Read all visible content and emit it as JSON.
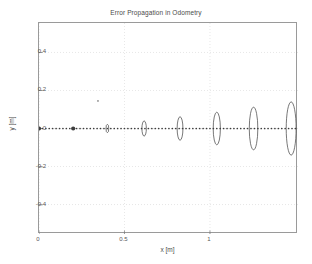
{
  "figure": {
    "background_color": "#ffffff",
    "axes_border_color": "#9a9a9a",
    "grid_color": "#cfcfcf",
    "data_color": "#3d3d3d"
  },
  "chart_data": {
    "type": "scatter",
    "title": "Error Propagation in Odometry",
    "xlabel": "x [m]",
    "ylabel": "y [m]",
    "xlim": [
      0,
      1.515
    ],
    "ylim": [
      -0.555,
      0.555
    ],
    "grid": true,
    "legend": null,
    "xticks": [
      0,
      0.5,
      1
    ],
    "xtick_labels": [
      "0",
      "0.5",
      "1"
    ],
    "yticks": [
      0.4,
      0.2,
      0,
      -0.2,
      -0.4
    ],
    "ytick_labels": [
      "0.4",
      "0.2",
      "0",
      "-0.2",
      "-0.4"
    ],
    "series": [
      {
        "name": "trajectory",
        "style": "dotted-path",
        "marker": "point",
        "x": [
          0.0,
          0.02,
          0.04,
          0.06,
          0.08,
          0.1,
          0.12,
          0.14,
          0.16,
          0.18,
          0.2,
          0.22,
          0.24,
          0.26,
          0.28,
          0.3,
          0.32,
          0.34,
          0.36,
          0.38,
          0.4,
          0.42,
          0.44,
          0.46,
          0.48,
          0.5,
          0.52,
          0.54,
          0.56,
          0.58,
          0.6,
          0.62,
          0.64,
          0.66,
          0.68,
          0.7,
          0.72,
          0.74,
          0.76,
          0.78,
          0.8,
          0.82,
          0.84,
          0.86,
          0.88,
          0.9,
          0.92,
          0.94,
          0.96,
          0.98,
          1.0,
          1.02,
          1.04,
          1.06,
          1.08,
          1.1,
          1.12,
          1.14,
          1.16,
          1.18,
          1.2,
          1.22,
          1.24,
          1.26,
          1.28,
          1.3,
          1.32,
          1.34,
          1.36,
          1.38,
          1.4,
          1.42,
          1.44,
          1.46,
          1.48,
          1.5
        ],
        "y": [
          0,
          0,
          0,
          0,
          0,
          0,
          0,
          0,
          0,
          0,
          0,
          0,
          0,
          0,
          0,
          0,
          0,
          0,
          0,
          0,
          0,
          0,
          0,
          0,
          0,
          0,
          0,
          0,
          0,
          0,
          0,
          0,
          0,
          0,
          0,
          0,
          0,
          0,
          0,
          0,
          0,
          0,
          0,
          0,
          0,
          0,
          0,
          0,
          0,
          0,
          0,
          0,
          0,
          0,
          0,
          0,
          0,
          0,
          0,
          0,
          0,
          0,
          0,
          0,
          0,
          0,
          0,
          0,
          0,
          0,
          0,
          0,
          0,
          0,
          0,
          0
        ]
      },
      {
        "name": "start-marker",
        "style": "filled-dot",
        "x": [
          0.0,
          0.2
        ],
        "y": [
          0.0,
          0.0
        ]
      },
      {
        "name": "stray-marker",
        "style": "tiny-dot",
        "x": [
          0.345
        ],
        "y": [
          0.145
        ]
      }
    ],
    "error_ellipses": [
      {
        "cx": 0.0,
        "cy": 0.0,
        "rx": 0.004,
        "ry": 0.009
      },
      {
        "cx": 0.4,
        "cy": 0.0,
        "rx": 0.008,
        "ry": 0.022
      },
      {
        "cx": 0.615,
        "cy": 0.0,
        "rx": 0.013,
        "ry": 0.04
      },
      {
        "cx": 0.825,
        "cy": 0.0,
        "rx": 0.017,
        "ry": 0.062
      },
      {
        "cx": 1.04,
        "cy": 0.0,
        "rx": 0.021,
        "ry": 0.086
      },
      {
        "cx": 1.255,
        "cy": 0.0,
        "rx": 0.025,
        "ry": 0.112
      },
      {
        "cx": 1.475,
        "cy": 0.0,
        "rx": 0.029,
        "ry": 0.14
      }
    ]
  }
}
